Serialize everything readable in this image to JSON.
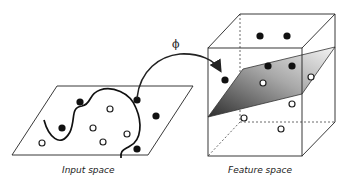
{
  "diagram": {
    "mapping_symbol": "ϕ",
    "input_space": {
      "label": "Input space",
      "filled_points": [
        [
          80,
          102
        ],
        [
          62,
          128
        ],
        [
          137,
          100
        ],
        [
          156,
          116
        ],
        [
          137,
          149
        ]
      ],
      "open_points": [
        [
          110,
          109
        ],
        [
          93,
          128
        ],
        [
          42,
          143
        ],
        [
          103,
          142
        ],
        [
          127,
          134
        ]
      ]
    },
    "feature_space": {
      "label": "Feature space",
      "filled_points": [
        [
          260,
          36
        ],
        [
          287,
          36
        ],
        [
          268,
          66
        ],
        [
          292,
          66
        ],
        [
          225,
          80
        ]
      ],
      "open_points": [
        [
          263,
          83
        ],
        [
          311,
          77
        ],
        [
          292,
          104
        ],
        [
          244,
          118
        ],
        [
          281,
          129
        ]
      ]
    },
    "colors": {
      "stroke": "#222222",
      "point_fill": "#111111",
      "plane_dark": "#3a3a3a",
      "plane_light": "#f0f0f0"
    }
  }
}
